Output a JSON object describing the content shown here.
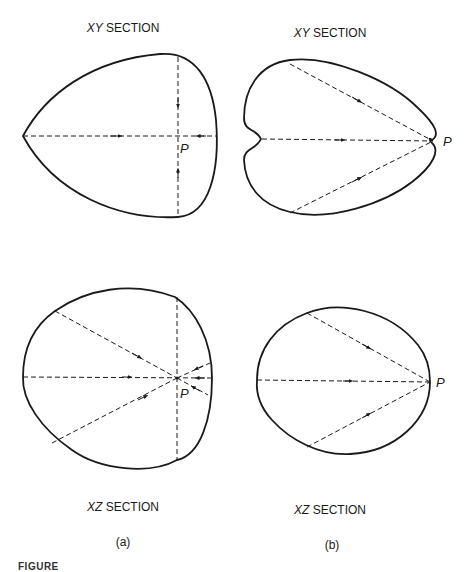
{
  "panels": [
    {
      "id": "a",
      "sublabel": "(a)",
      "xy": {
        "axis": "XY",
        "title": "SECTION",
        "point_label": "P"
      },
      "xz": {
        "axis": "XZ",
        "title": "SECTION",
        "point_label": "P"
      }
    },
    {
      "id": "b",
      "sublabel": "(b)",
      "xy": {
        "axis": "XY",
        "title": "SECTION",
        "point_label": "P"
      },
      "xz": {
        "axis": "XZ",
        "title": "SECTION",
        "point_label": "P"
      }
    }
  ],
  "caption": "FIGURE",
  "colors": {
    "stroke": "#1a1a1a",
    "background": "#ffffff"
  }
}
